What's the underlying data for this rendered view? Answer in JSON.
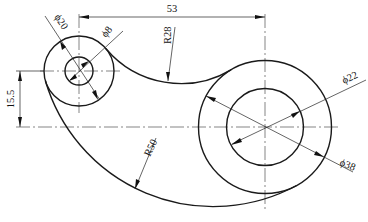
{
  "drawing": {
    "type": "mechanical-part-drawing",
    "units_scale_px_per_unit": 3.5,
    "line_color": "#1a1a1a",
    "background": "#ffffff"
  },
  "features": {
    "small_boss": {
      "center": [
        79,
        71
      ],
      "outer_diameter": 20,
      "hole_diameter": 8
    },
    "large_boss": {
      "center": [
        265,
        127
      ],
      "outer_diameter": 38,
      "hole_diameter": 22
    },
    "upper_blend_radius": 28,
    "lower_blend_radius": 50
  },
  "dimensions": {
    "horizontal_center_distance": "53",
    "vertical_center_offset": "15.5",
    "small_outer_dia": "ϕ20",
    "small_hole_dia": "ϕ8",
    "upper_arc_radius": "R28",
    "large_hole_dia": "ϕ22",
    "large_outer_dia": "ϕ38",
    "lower_arc_radius": "R50"
  }
}
